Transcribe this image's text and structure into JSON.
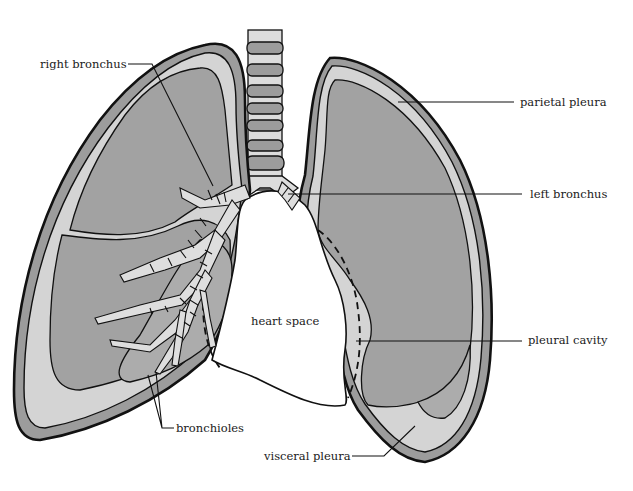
{
  "diagram": {
    "type": "anatomical-illustration",
    "colors": {
      "background": "#ffffff",
      "parietal_pleura": "#9c9c9c",
      "pleural_cavity": "#d4d4d4",
      "lung_tissue": "#a2a2a2",
      "outline": "#111111"
    },
    "labels": {
      "right_bronchus": "right bronchus",
      "parietal_pleura": "parietal pleura",
      "left_bronchus": "left bronchus",
      "heart_space": "heart space",
      "pleural_cavity": "pleural cavity",
      "bronchioles": "bronchioles",
      "visceral_pleura": "visceral pleura"
    }
  }
}
